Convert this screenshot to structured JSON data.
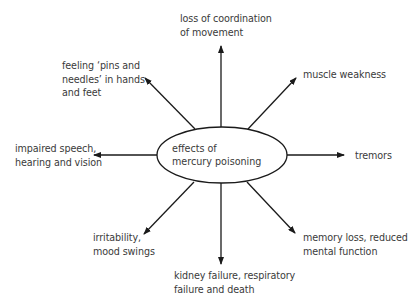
{
  "diagram": {
    "center": {
      "line1": "effects of",
      "line2": "mercury poisoning"
    },
    "effects": [
      {
        "id": "top",
        "line1": "loss of coordination",
        "line2": "of movement"
      },
      {
        "id": "top-right",
        "line1": "muscle weakness"
      },
      {
        "id": "right",
        "line1": "tremors"
      },
      {
        "id": "bottom-right",
        "line1": "memory loss, reduced",
        "line2": "mental function"
      },
      {
        "id": "bottom",
        "line1": "kidney failure, respiratory",
        "line2": "failure and death"
      },
      {
        "id": "bottom-left",
        "line1": "irritability,",
        "line2": "mood swings"
      },
      {
        "id": "left",
        "line1": "impaired speech,",
        "line2": "hearing and vision"
      },
      {
        "id": "top-left",
        "line1": "feeling ‘pins and",
        "line2": "needles’ in hands",
        "line3": "and feet"
      }
    ],
    "colors": {
      "stroke": "#1a1a1a",
      "text": "#3a3a3a",
      "background": "#ffffff"
    }
  }
}
